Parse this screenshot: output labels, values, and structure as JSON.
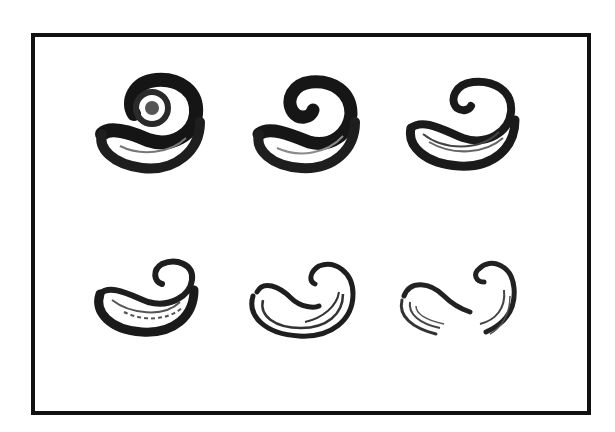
{
  "diagram": {
    "type": "figure-grid",
    "rows": 2,
    "columns": 3,
    "frame": {
      "border_color": "#111111",
      "background": "#ffffff"
    },
    "figures": [
      {
        "id": 1,
        "row": 1,
        "col": 1,
        "stage": "tight coil, dense center",
        "shading": "dark"
      },
      {
        "id": 2,
        "row": 1,
        "col": 2,
        "stage": "coil with small open center",
        "shading": "dark"
      },
      {
        "id": 3,
        "row": 1,
        "col": 3,
        "stage": "loosened coil, hollow body",
        "shading": "medium"
      },
      {
        "id": 4,
        "row": 2,
        "col": 1,
        "stage": "open hook, inner curl",
        "shading": "medium"
      },
      {
        "id": 5,
        "row": 2,
        "col": 2,
        "stage": "open double-line hook",
        "shading": "light"
      },
      {
        "id": 6,
        "row": 2,
        "col": 3,
        "stage": "split into two separate hooks",
        "shading": "light"
      }
    ]
  }
}
